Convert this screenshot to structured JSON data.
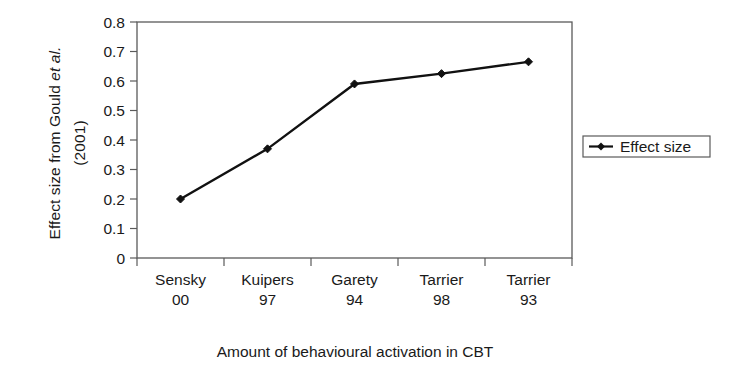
{
  "chart_data": {
    "type": "line",
    "title": "",
    "xlabel": "Amount of behavioural activation in CBT",
    "ylabel_line1": "Effect size from Gould ",
    "ylabel_italic": "et al.",
    "ylabel_line2": "(2001)",
    "categories": [
      "Sensky 00",
      "Kuipers 97",
      "Garety 94",
      "Tarrier 98",
      "Tarrier 93"
    ],
    "category_lines": [
      [
        "Sensky",
        "00"
      ],
      [
        "Kuipers",
        "97"
      ],
      [
        "Garety",
        "94"
      ],
      [
        "Tarrier",
        "98"
      ],
      [
        "Tarrier",
        "93"
      ]
    ],
    "series": [
      {
        "name": "Effect size",
        "values": [
          0.2,
          0.37,
          0.59,
          0.625,
          0.665
        ],
        "color": "#111111",
        "marker": "diamond"
      }
    ],
    "ylim": [
      0,
      0.8
    ],
    "ytick_values": [
      0,
      0.1,
      0.2,
      0.3,
      0.4,
      0.5,
      0.6,
      0.7,
      0.8
    ],
    "ytick_labels": [
      "0",
      "0.1",
      "0.2",
      "0.3",
      "0.4",
      "0.5",
      "0.6",
      "0.7",
      "0.8"
    ],
    "grid": false,
    "frame": "box",
    "legend": {
      "position": "right",
      "entries": [
        "Effect size"
      ]
    },
    "colors": {
      "line": "#111111",
      "axis": "#5a5a5a",
      "text": "#1a1a1a",
      "background": "#ffffff"
    }
  }
}
